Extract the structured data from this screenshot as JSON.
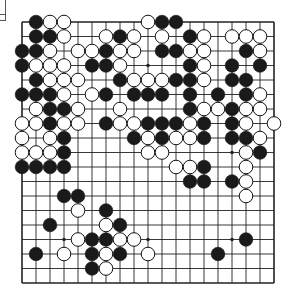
{
  "board": {
    "size": 19,
    "origin_x": 22,
    "origin_y": 22,
    "spacing_x": 14,
    "spacing_y": 14.5,
    "line_color": "#222222",
    "black_color": "#1a1a1a",
    "white_color": "#ffffff",
    "star_points": [
      [
        4,
        4
      ],
      [
        4,
        10
      ],
      [
        4,
        16
      ],
      [
        10,
        4
      ],
      [
        10,
        10
      ],
      [
        10,
        16
      ],
      [
        16,
        4
      ],
      [
        16,
        10
      ],
      [
        16,
        16
      ]
    ],
    "rows": [
      {
        "row": 1,
        "black": [
          2,
          11,
          12
        ],
        "white": [
          3,
          4,
          10
        ]
      },
      {
        "row": 2,
        "black": [
          2,
          3,
          8,
          13
        ],
        "white": [
          4,
          7,
          9,
          11,
          14,
          16,
          17,
          18
        ]
      },
      {
        "row": 3,
        "black": [
          1,
          2,
          7,
          11,
          12,
          17
        ],
        "white": [
          3,
          5,
          6,
          8,
          9,
          13,
          14,
          18
        ]
      },
      {
        "row": 4,
        "black": [
          1,
          6,
          7,
          13,
          16,
          18
        ],
        "white": [
          2,
          3,
          4,
          8,
          14
        ]
      },
      {
        "row": 5,
        "black": [
          2,
          8,
          12,
          13,
          16,
          17
        ],
        "white": [
          3,
          4,
          5,
          9,
          10,
          11,
          14
        ]
      },
      {
        "row": 6,
        "black": [
          1,
          2,
          3,
          7,
          9,
          10,
          11,
          13,
          15,
          17
        ],
        "white": [
          4,
          6,
          18
        ]
      },
      {
        "row": 7,
        "black": [
          3,
          4,
          13,
          16
        ],
        "white": [
          2,
          5,
          8,
          14,
          15,
          17,
          18
        ]
      },
      {
        "row": 8,
        "black": [
          3,
          7,
          10,
          11,
          12,
          14,
          16
        ],
        "white": [
          1,
          2,
          4,
          5,
          8,
          9,
          13,
          17,
          19
        ]
      },
      {
        "row": 9,
        "black": [
          4,
          9,
          11,
          14,
          16,
          17
        ],
        "white": [
          1,
          3,
          10,
          12,
          13,
          18
        ]
      },
      {
        "row": 10,
        "black": [
          4,
          18
        ],
        "white": [
          1,
          2,
          3,
          10,
          11,
          17
        ]
      },
      {
        "row": 11,
        "black": [
          1,
          2,
          3,
          4,
          14
        ],
        "white": [
          12,
          13,
          17
        ]
      },
      {
        "row": 12,
        "black": [
          13,
          14,
          16
        ],
        "white": [
          17
        ]
      },
      {
        "row": 13,
        "black": [
          4,
          5
        ],
        "white": [
          17
        ]
      },
      {
        "row": 14,
        "black": [
          7
        ],
        "white": [
          5
        ]
      },
      {
        "row": 15,
        "black": [
          3,
          8
        ],
        "white": [
          7
        ]
      },
      {
        "row": 16,
        "black": [
          6,
          7,
          17
        ],
        "white": [
          5,
          8,
          9
        ]
      },
      {
        "row": 17,
        "black": [
          2,
          6,
          8,
          15
        ],
        "white": [
          4,
          7,
          10
        ]
      },
      {
        "row": 18,
        "black": [
          6
        ],
        "white": [
          7
        ]
      },
      {
        "row": 19,
        "black": [],
        "white": []
      }
    ]
  }
}
